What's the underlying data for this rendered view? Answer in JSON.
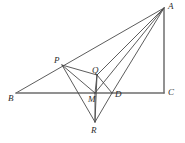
{
  "figure": {
    "width": 185,
    "height": 143,
    "background_color": "#ffffff",
    "line_color": "#4a4a4a",
    "baseline_color": "#6e6e6e",
    "label_color": "#2b2b2b",
    "points": [
      {
        "id": "A",
        "label": "A",
        "x": 164,
        "y": 8,
        "label_x": 168,
        "label_y": 2
      },
      {
        "id": "B",
        "label": "B",
        "x": 16,
        "y": 93,
        "label_x": 8,
        "label_y": 94
      },
      {
        "id": "C",
        "label": "C",
        "x": 164,
        "y": 93,
        "label_x": 168,
        "label_y": 88
      },
      {
        "id": "P",
        "label": "P",
        "x": 62,
        "y": 65,
        "label_x": 54,
        "label_y": 56
      },
      {
        "id": "Q",
        "label": "Q",
        "x": 97,
        "y": 75,
        "label_x": 92,
        "label_y": 66
      },
      {
        "id": "M",
        "label": "M",
        "x": 95,
        "y": 93,
        "label_x": 88,
        "label_y": 95
      },
      {
        "id": "D",
        "label": "D",
        "x": 112,
        "y": 93,
        "label_x": 115,
        "label_y": 90
      },
      {
        "id": "R",
        "label": "R",
        "x": 95,
        "y": 122,
        "label_x": 91,
        "label_y": 126
      }
    ],
    "segments": [
      {
        "name": "segment-B-A",
        "from": "B",
        "to": "A",
        "style": "thin"
      },
      {
        "name": "segment-B-C",
        "from": "B",
        "to": "C",
        "style": "thick"
      },
      {
        "name": "segment-A-C",
        "from": "A",
        "to": "C",
        "style": "thick"
      },
      {
        "name": "segment-A-Q",
        "from": "A",
        "to": "Q",
        "style": "thin"
      },
      {
        "name": "segment-A-M",
        "from": "A",
        "to": "M",
        "style": "thin"
      },
      {
        "name": "segment-A-D",
        "from": "A",
        "to": "D",
        "style": "thin"
      },
      {
        "name": "segment-P-Q",
        "from": "P",
        "to": "Q",
        "style": "thin"
      },
      {
        "name": "segment-P-M",
        "from": "P",
        "to": "M",
        "style": "thin"
      },
      {
        "name": "segment-P-R",
        "from": "P",
        "to": "R",
        "style": "thin"
      },
      {
        "name": "segment-Q-M",
        "from": "Q",
        "to": "M",
        "style": "thin"
      },
      {
        "name": "segment-Q-D",
        "from": "Q",
        "to": "D",
        "style": "thin"
      },
      {
        "name": "segment-Q-R",
        "from": "Q",
        "to": "R",
        "style": "thin"
      },
      {
        "name": "segment-M-R",
        "from": "M",
        "to": "R",
        "style": "thin"
      },
      {
        "name": "segment-D-R",
        "from": "D",
        "to": "R",
        "style": "thin"
      }
    ]
  }
}
